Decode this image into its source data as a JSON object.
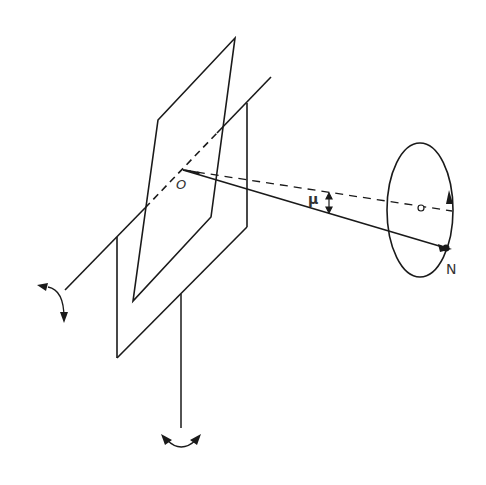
{
  "figure": {
    "background": "#ffffff",
    "stroke_color": "#1a1a1a",
    "labels": {
      "origin": "O",
      "angle": "μ",
      "point": "N"
    },
    "elements": [
      "rotation-axis",
      "tilted-plate",
      "vertical-plate",
      "vertical-stem",
      "line-O-to-N",
      "dashed-line-O-to-center",
      "precession-ellipse",
      "ellipse-center-point",
      "angle-mu-arrow",
      "axis-rotation-arrow",
      "stem-rotation-arrow"
    ]
  }
}
